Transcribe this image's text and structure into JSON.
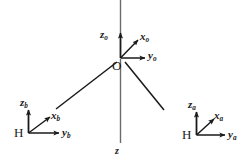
{
  "diagram": {
    "stroke_color": "#1a1a1a",
    "background_color": "#ffffff",
    "origin": {
      "label": "O",
      "axes": [
        {
          "name": "z",
          "subscript": "o"
        },
        {
          "name": "x",
          "subscript": "o"
        },
        {
          "name": "y",
          "subscript": "o"
        }
      ]
    },
    "left_frame": {
      "label": "H",
      "axes": [
        {
          "name": "z",
          "subscript": "b"
        },
        {
          "name": "x",
          "subscript": "b"
        },
        {
          "name": "y",
          "subscript": "b"
        }
      ]
    },
    "right_frame": {
      "label": "H",
      "axes": [
        {
          "name": "z",
          "subscript": "a"
        },
        {
          "name": "x",
          "subscript": "a"
        },
        {
          "name": "y",
          "subscript": "a"
        }
      ]
    },
    "vertical_axis": {
      "label": "z"
    },
    "labels": {
      "z_o": "z",
      "z_o_sub": "o",
      "x_o": "x",
      "x_o_sub": "o",
      "y_o": "y",
      "y_o_sub": "o",
      "origin_point": "O",
      "z_b": "z",
      "z_b_sub": "b",
      "x_b": "x",
      "x_b_sub": "b",
      "y_b": "y",
      "y_b_sub": "b",
      "h_left": "H",
      "z_a": "z",
      "z_a_sub": "a",
      "x_a": "x",
      "x_a_sub": "a",
      "y_a": "y",
      "y_a_sub": "a",
      "h_right": "H",
      "z_bottom": "z"
    }
  }
}
